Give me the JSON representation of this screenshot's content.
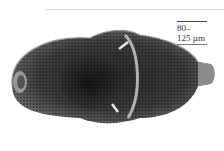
{
  "image": {
    "subject": "SEM micrograph of a diatom frustule (elongate, porous valve)",
    "background_color": "#ffffff"
  },
  "scale_label": {
    "line1": "80–",
    "line2": "125 µm"
  }
}
